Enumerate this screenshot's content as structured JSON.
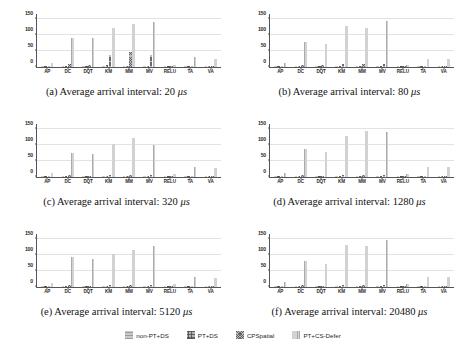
{
  "figure": {
    "categories": [
      "AP",
      "DC",
      "DQT",
      "KM",
      "MM",
      "MV",
      "RELU",
      "TA",
      "VA"
    ],
    "yticks": [
      0,
      50,
      100,
      150
    ],
    "ylim": [
      0,
      165
    ],
    "series_names": [
      "non-PT+DS",
      "PT+DS",
      "CPSpatial",
      "PT+CS-Defer"
    ]
  },
  "legend": {
    "position": "bottom-center",
    "items": [
      {
        "label": "non-PT+DS",
        "swatch": "pattern-horizontal-light"
      },
      {
        "label": "PT+DS",
        "swatch": "pattern-crosshatch-grid"
      },
      {
        "label": "CPSpatial",
        "swatch": "pattern-diagonal-crosshatch"
      },
      {
        "label": "PT+CS-Defer",
        "swatch": "pattern-vertical-light"
      }
    ]
  },
  "chart_data": [
    {
      "type": "bar",
      "panel": "a",
      "title": "(a) Average arrival interval: 20 μs",
      "caption_prefix": "(a) Average arrival interval: 20 ",
      "caption_unit": "μs",
      "categories": [
        "AP",
        "DC",
        "DQT",
        "KM",
        "MM",
        "MV",
        "RELU",
        "TA",
        "VA"
      ],
      "xlabel": "",
      "ylabel": "",
      "ylim": [
        0,
        165
      ],
      "yticks": [
        0,
        50,
        100,
        150
      ],
      "grid": true,
      "series": [
        {
          "name": "non-PT+DS",
          "values": [
            2,
            3,
            2,
            3,
            3,
            3,
            1,
            2,
            2
          ]
        },
        {
          "name": "PT+DS",
          "values": [
            3,
            4,
            3,
            5,
            4,
            4,
            1,
            3,
            3
          ]
        },
        {
          "name": "CPSpatial",
          "values": [
            4,
            10,
            5,
            37,
            47,
            38,
            2,
            3,
            4
          ]
        },
        {
          "name": "PT+CS-Defer",
          "values": [
            13,
            91,
            90,
            123,
            133,
            139,
            7,
            31,
            24
          ]
        }
      ]
    },
    {
      "type": "bar",
      "panel": "b",
      "title": "(b) Average arrival interval: 80 μs",
      "caption_prefix": "(b) Average arrival interval: 80 ",
      "caption_unit": "μs",
      "categories": [
        "AP",
        "DC",
        "DQT",
        "KM",
        "MM",
        "MV",
        "RELU",
        "TA",
        "VA"
      ],
      "xlabel": "",
      "ylabel": "",
      "ylim": [
        0,
        165
      ],
      "yticks": [
        0,
        50,
        100,
        150
      ],
      "grid": true,
      "series": [
        {
          "name": "non-PT+DS",
          "values": [
            2,
            3,
            2,
            3,
            3,
            3,
            1,
            2,
            2
          ]
        },
        {
          "name": "PT+DS",
          "values": [
            3,
            4,
            3,
            4,
            4,
            4,
            1,
            3,
            3
          ]
        },
        {
          "name": "CPSpatial",
          "values": [
            4,
            6,
            5,
            8,
            9,
            8,
            2,
            4,
            4
          ]
        },
        {
          "name": "PT+CS-Defer",
          "values": [
            12,
            78,
            72,
            127,
            121,
            142,
            6,
            24,
            26
          ]
        }
      ]
    },
    {
      "type": "bar",
      "panel": "c",
      "title": "(c) Average arrival interval: 320 μs",
      "caption_prefix": "(c) Average arrival interval: 320 ",
      "caption_unit": "μs",
      "categories": [
        "AP",
        "DC",
        "DQT",
        "KM",
        "MM",
        "MV",
        "RELU",
        "TA",
        "VA"
      ],
      "xlabel": "",
      "ylabel": "",
      "ylim": [
        0,
        165
      ],
      "yticks": [
        0,
        50,
        100,
        150
      ],
      "grid": true,
      "series": [
        {
          "name": "non-PT+DS",
          "values": [
            2,
            3,
            2,
            3,
            3,
            3,
            1,
            2,
            2
          ]
        },
        {
          "name": "PT+DS",
          "values": [
            3,
            4,
            3,
            4,
            4,
            4,
            1,
            3,
            3
          ]
        },
        {
          "name": "CPSpatial",
          "values": [
            4,
            5,
            4,
            6,
            6,
            6,
            2,
            4,
            4
          ]
        },
        {
          "name": "PT+CS-Defer",
          "values": [
            14,
            74,
            73,
            103,
            120,
            99,
            9,
            30,
            29
          ]
        }
      ]
    },
    {
      "type": "bar",
      "panel": "d",
      "title": "(d) Average arrival interval: 1280 μs",
      "caption_prefix": "(d) Average arrival interval: 1280 ",
      "caption_unit": "μs",
      "categories": [
        "AP",
        "DC",
        "DQT",
        "KM",
        "MM",
        "MV",
        "RELU",
        "TA",
        "VA"
      ],
      "xlabel": "",
      "ylabel": "",
      "ylim": [
        0,
        165
      ],
      "yticks": [
        0,
        50,
        100,
        150
      ],
      "grid": true,
      "series": [
        {
          "name": "non-PT+DS",
          "values": [
            2,
            3,
            2,
            3,
            3,
            3,
            1,
            2,
            2
          ]
        },
        {
          "name": "PT+DS",
          "values": [
            3,
            4,
            3,
            4,
            4,
            4,
            1,
            3,
            3
          ]
        },
        {
          "name": "CPSpatial",
          "values": [
            4,
            5,
            4,
            5,
            6,
            5,
            2,
            4,
            4
          ]
        },
        {
          "name": "PT+CS-Defer",
          "values": [
            14,
            88,
            77,
            127,
            143,
            139,
            9,
            30,
            30
          ]
        }
      ]
    },
    {
      "type": "bar",
      "panel": "e",
      "title": "(e) Average arrival interval: 5120 μs",
      "caption_prefix": "(e) Average arrival interval: 5120 ",
      "caption_unit": "μs",
      "categories": [
        "AP",
        "DC",
        "DQT",
        "KM",
        "MM",
        "MV",
        "RELU",
        "TA",
        "VA"
      ],
      "xlabel": "",
      "ylabel": "",
      "ylim": [
        0,
        165
      ],
      "yticks": [
        0,
        50,
        100,
        150
      ],
      "grid": true,
      "series": [
        {
          "name": "non-PT+DS",
          "values": [
            2,
            3,
            2,
            3,
            3,
            3,
            1,
            2,
            2
          ]
        },
        {
          "name": "PT+DS",
          "values": [
            3,
            4,
            3,
            4,
            4,
            4,
            1,
            3,
            3
          ]
        },
        {
          "name": "CPSpatial",
          "values": [
            4,
            5,
            4,
            5,
            5,
            5,
            2,
            4,
            4
          ]
        },
        {
          "name": "PT+CS-Defer",
          "values": [
            14,
            93,
            86,
            103,
            115,
            129,
            9,
            32,
            28
          ]
        }
      ]
    },
    {
      "type": "bar",
      "panel": "f",
      "title": "(f) Average arrival interval: 20480 μs",
      "caption_prefix": "(f) Average arrival interval: 20480 ",
      "caption_unit": "μs",
      "categories": [
        "AP",
        "DC",
        "DQT",
        "KM",
        "MM",
        "MV",
        "RELU",
        "TA",
        "VA"
      ],
      "xlabel": "",
      "ylabel": "",
      "ylim": [
        0,
        165
      ],
      "yticks": [
        0,
        50,
        100,
        150
      ],
      "grid": true,
      "series": [
        {
          "name": "non-PT+DS",
          "values": [
            2,
            3,
            2,
            3,
            3,
            3,
            1,
            2,
            2
          ]
        },
        {
          "name": "PT+DS",
          "values": [
            3,
            4,
            3,
            4,
            4,
            4,
            1,
            3,
            3
          ]
        },
        {
          "name": "CPSpatial",
          "values": [
            4,
            5,
            4,
            5,
            5,
            5,
            2,
            4,
            4
          ]
        },
        {
          "name": "PT+CS-Defer",
          "values": [
            16,
            81,
            72,
            131,
            129,
            147,
            8,
            31,
            32
          ]
        }
      ]
    }
  ]
}
